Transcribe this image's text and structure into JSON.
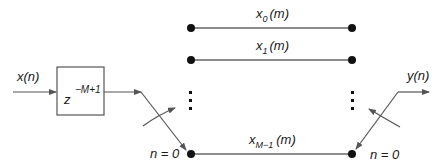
{
  "diagram": {
    "input": {
      "label_var": "x",
      "label_arg": "n"
    },
    "delay_block": {
      "base": "z",
      "exponent": "−M+1"
    },
    "output": {
      "label_var": "y",
      "label_arg": "n"
    },
    "channels": [
      {
        "var": "x",
        "sub": "0",
        "arg": "(m)"
      },
      {
        "var": "x",
        "sub": "1",
        "arg": "(m)"
      },
      {
        "var": "x",
        "sub": "M−1",
        "arg": "(m)"
      }
    ],
    "ellipsis": "⋮",
    "commutator_left": {
      "label": "n = 0"
    },
    "commutator_right": {
      "label": "n = 0"
    },
    "colors": {
      "line": "#555555",
      "node": "#111111",
      "text": "#1a1a1a"
    }
  }
}
